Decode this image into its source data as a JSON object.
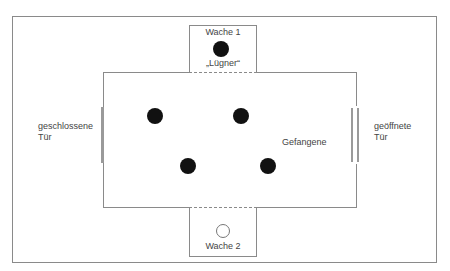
{
  "diagram": {
    "type": "floor-plan",
    "colors": {
      "line": "#8a8a8a",
      "person_filled": "#111111",
      "person_hollow_border": "#777777",
      "door": "#9a9a9a",
      "text": "#444444"
    },
    "guard_top": {
      "title": "Wache 1",
      "subtitle": "„Lügner“",
      "marker": "filled-circle"
    },
    "guard_bottom": {
      "title": "Wache 2",
      "marker": "hollow-circle"
    },
    "prisoners": {
      "label": "Gefangene",
      "count": 4
    },
    "door_left": {
      "line1": "geschlossene",
      "line2": "Tür",
      "state": "closed"
    },
    "door_right": {
      "line1": "geöffnete",
      "line2": "Tür",
      "state": "open"
    }
  }
}
